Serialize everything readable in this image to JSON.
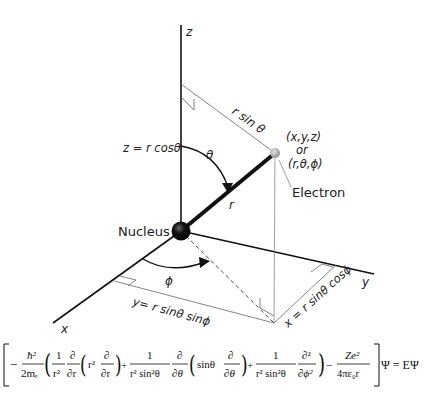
{
  "diagram": {
    "axes": {
      "z": "z",
      "y": "y",
      "x": "x"
    },
    "labels": {
      "r_sin_theta": "r sin θ",
      "z_eq": "z = r cosθ",
      "theta": "θ",
      "r": "r",
      "phi": "ϕ",
      "point_cartesian": "(x,y,z)",
      "or": "or",
      "point_spherical": "(r,θ,ϕ)",
      "electron": "Electron",
      "nucleus": "Nucleus",
      "y_eq": "y= r sinθ sinϕ",
      "x_eq": "x = r sinθ cosϕ"
    },
    "colors": {
      "line": "#111111",
      "thin_line": "#666666",
      "nucleus": "#111111",
      "electron": "#9a9a9a"
    }
  },
  "equation": {
    "text": "[ −ħ²/2mₑ ( 1/r² ∂/∂r ( r² ∂/∂r ) + 1/(r² sin²θ) ∂/∂θ ( sinθ ∂/∂θ ) + 1/(r² sin²θ) ∂²/∂ϕ² ) − Ze²/4πε₀r ] Ψ = EΨ",
    "t1_num": "ħ²",
    "t1_den": "2mₑ",
    "one": "1",
    "r2": "r²",
    "d": "∂",
    "dr": "∂r",
    "r2b": "r²",
    "r2sin2": "r² sin²θ",
    "dtheta": "∂θ",
    "sintheta": "sinθ",
    "d2": "∂²",
    "dphi2": "∂ϕ²",
    "ze2": "Ze²",
    "den4pi": "4πε₀r",
    "rhs": "Ψ = EΨ",
    "minus": "−",
    "plus": "+"
  }
}
